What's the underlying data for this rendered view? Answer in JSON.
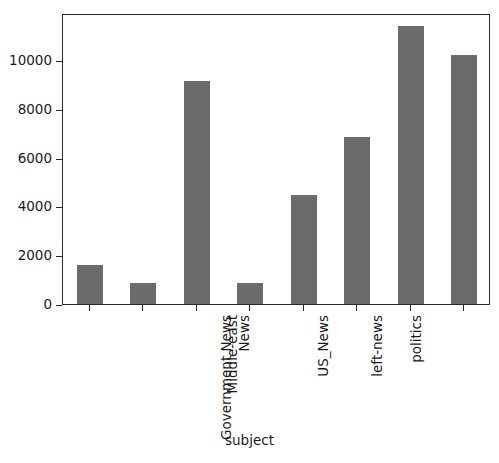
{
  "chart_data": {
    "type": "bar",
    "title": "",
    "xlabel": "subject",
    "ylabel": "",
    "categories": [
      "Government News",
      "Middle-east",
      "News",
      "US_News",
      "left-news",
      "politics",
      "politicsNews",
      "worldnews"
    ],
    "values": [
      1598,
      860,
      9139,
      860,
      4467,
      6844,
      11393,
      10205
    ],
    "ylim": [
      0,
      11930
    ],
    "xlim": [
      -0.5,
      7.5
    ],
    "yticks": [
      0,
      2000,
      4000,
      6000,
      8000,
      10000
    ],
    "ytick_labels": [
      "0",
      "2000",
      "4000",
      "6000",
      "8000",
      "10000"
    ],
    "grid": false,
    "legend": null,
    "bar_color": "#6b6b6b",
    "axis_color": "#2b2b2b",
    "background": "#ffffff",
    "xtick_rotation": -90
  },
  "axis": {
    "x_title": "subject"
  }
}
